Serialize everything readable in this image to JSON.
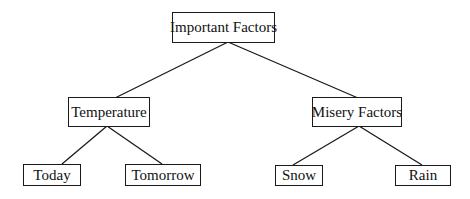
{
  "diagram": {
    "type": "tree",
    "root": {
      "label": "Important Factors",
      "children": [
        {
          "label": "Temperature",
          "children": [
            {
              "label": "Today"
            },
            {
              "label": "Tomorrow"
            }
          ]
        },
        {
          "label": "Misery Factors",
          "children": [
            {
              "label": "Snow"
            },
            {
              "label": "Rain"
            }
          ]
        }
      ]
    },
    "nodes": {
      "important_factors": "Important Factors",
      "temperature": "Temperature",
      "misery_factors": "Misery Factors",
      "today": "Today",
      "tomorrow": "Tomorrow",
      "snow": "Snow",
      "rain": "Rain"
    },
    "colors": {
      "line": "#1a1a1a",
      "box_border": "#1a1a1a",
      "background": "#ffffff",
      "text": "#111111"
    }
  }
}
